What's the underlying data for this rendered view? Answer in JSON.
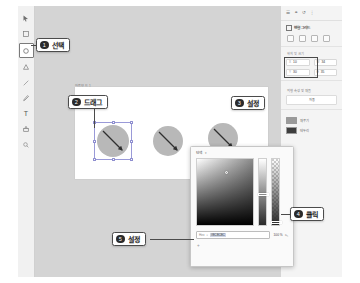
{
  "toolbar": {
    "tools": [
      {
        "name": "pointer-tool",
        "label": "선택 도구",
        "selected": false
      },
      {
        "name": "rectangle-tool",
        "label": "사각형",
        "selected": false
      },
      {
        "name": "ellipse-tool",
        "label": "원형",
        "selected": true
      },
      {
        "name": "triangle-tool",
        "label": "삼각형",
        "selected": false
      },
      {
        "name": "line-tool",
        "label": "선",
        "selected": false
      },
      {
        "name": "pen-tool",
        "label": "펜",
        "selected": false
      },
      {
        "name": "text-tool",
        "label": "텍스트",
        "selected": false
      },
      {
        "name": "stamp-tool",
        "label": "스탬프",
        "selected": false
      },
      {
        "name": "zoom-tool",
        "label": "확대",
        "selected": false
      }
    ]
  },
  "canvas": {
    "artboard_label": "아트보드 1",
    "shapes": [
      {
        "name": "ellipse-1",
        "selected": true
      },
      {
        "name": "ellipse-2",
        "selected": false
      },
      {
        "name": "ellipse-3",
        "selected": false
      }
    ]
  },
  "right_panel": {
    "header_icons": [
      "layers-icon",
      "link-icon",
      "history-icon",
      "more-icon"
    ],
    "section_title": "변형 그리드",
    "align_buttons": [
      "align-left-icon",
      "align-center-icon",
      "align-right-icon",
      "align-distribute-icon"
    ],
    "position_label": "위치 및 크기",
    "fields": [
      {
        "key": "X",
        "value": "10"
      },
      {
        "key": "W",
        "value": "34"
      },
      {
        "key": "Y",
        "value": "30"
      },
      {
        "key": "H",
        "value": "35"
      }
    ],
    "appearance_label": "외형 속성 및 채움",
    "appearance_value": "자동",
    "fill_label": "채우기",
    "stroke_label": "테두리",
    "fill_color": "#9a9a9a",
    "stroke_color": "#3d3d3d"
  },
  "color_picker": {
    "mode": "단색",
    "hex_key": "Hex",
    "hex_value": "#8C8C8C",
    "opacity": "100 %",
    "eyedropper": "eyedropper-icon",
    "add": "+"
  },
  "callouts": [
    {
      "num": "1",
      "text": "선택"
    },
    {
      "num": "2",
      "text": "드래그"
    },
    {
      "num": "3",
      "text": "설정"
    },
    {
      "num": "4",
      "text": "클릭"
    },
    {
      "num": "5",
      "text": "설정"
    }
  ]
}
